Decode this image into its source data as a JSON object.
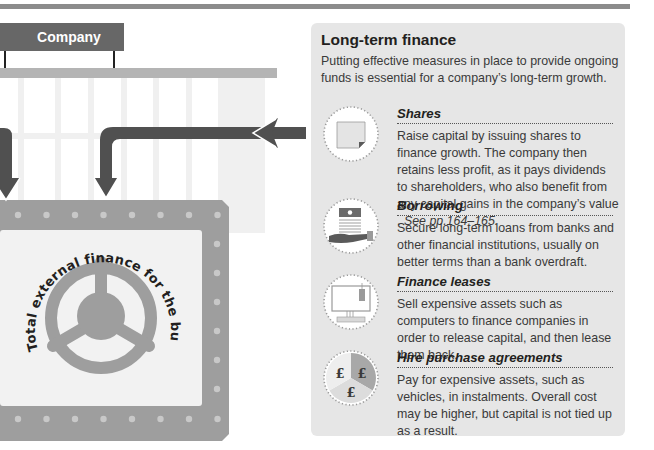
{
  "diagram": {
    "company_label": "Company",
    "safe_arc_text": "Total external finance for the business",
    "colors": {
      "arrow": "#505050",
      "safe": "#9e9e9e",
      "safe_inner": "#f2f2f2",
      "rivet": "#c8c8c8",
      "sign": "#676767"
    }
  },
  "panel": {
    "title": "Long-term finance",
    "intro": "Putting effective measures in place to provide ongoing funds is essential for a company’s long-term growth.",
    "items": [
      {
        "icon": "share-certificate-icon",
        "heading": "Shares",
        "text": "Raise capital by issuing shares to finance growth. The company then retains less profit, as it pays dividends to shareholders, who also benefit from any capital gains in the company’s value . ",
        "reference": "See pp.164–165."
      },
      {
        "icon": "hand-holding-banknotes-icon",
        "heading": "Borrowing",
        "text": "Secure long-term loans from banks and other financial institutions, usually on better terms than a bank overdraft."
      },
      {
        "icon": "computer-with-price-tag-icon",
        "heading": "Finance leases",
        "text": "Sell expensive assets such as computers to finance companies in order to release capital, and then lease them back."
      },
      {
        "icon": "pound-pie-icon",
        "heading": "Hire purchase agreements",
        "text": "Pay for expensive assets, such as vehicles, in instalments. Overall cost may be higher, but capital is not tied up as a result.",
        "pound_symbol": "£"
      }
    ]
  }
}
